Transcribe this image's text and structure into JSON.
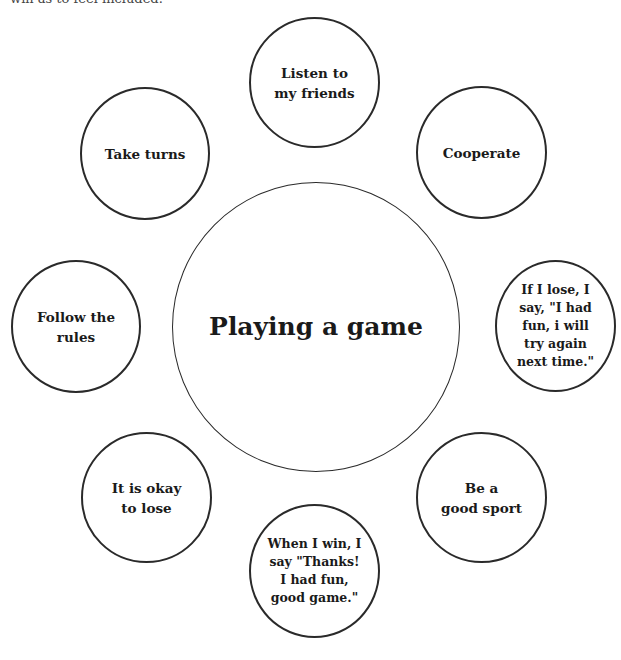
{
  "header": {
    "partial_text": "win as to feel included."
  },
  "diagram": {
    "center": {
      "label": "Playing a game"
    },
    "nodes": [
      {
        "id": "listen",
        "label": "Listen to\nmy friends"
      },
      {
        "id": "take-turns",
        "label": "Take turns"
      },
      {
        "id": "cooperate",
        "label": "Cooperate"
      },
      {
        "id": "follow-rules",
        "label": "Follow the\nrules"
      },
      {
        "id": "if-lose",
        "label": "If I lose, I\nsay, \"I had\nfun, i will\ntry again\nnext time.\""
      },
      {
        "id": "okay-to-lose",
        "label": "It is okay\nto lose"
      },
      {
        "id": "good-sport",
        "label": "Be a\ngood sport"
      },
      {
        "id": "when-win",
        "label": "When I win, I\nsay \"Thanks!\nI had fun,\ngood game.\""
      }
    ]
  },
  "colors": {
    "stroke": "#2a2a2a",
    "text": "#1a1a1a",
    "background": "#ffffff"
  }
}
